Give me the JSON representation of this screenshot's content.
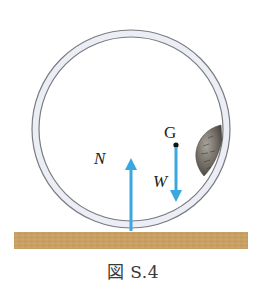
{
  "figure": {
    "caption": "図 S.4",
    "labels": {
      "center_of_gravity": "G",
      "normal_force": "N",
      "weight": "W"
    },
    "colors": {
      "arrow": "#3aa7e0",
      "ground": "#c9a064",
      "ring_fill": "#eceef6",
      "ring_stroke": "#7a7a80",
      "mass": "#6e6a62"
    }
  }
}
